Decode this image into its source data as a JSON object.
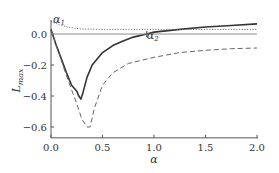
{
  "chart_data": {
    "type": "line",
    "title": "",
    "xlabel": "α",
    "ylabel": "L_max",
    "xlim": [
      0.0,
      2.0
    ],
    "ylim": [
      -0.67,
      0.09
    ],
    "grid": false,
    "legend": null,
    "x_ticks": [
      "0.0",
      "0.5",
      "1.0",
      "1.5",
      "2.0"
    ],
    "y_ticks": [
      "0.0",
      "-0.2",
      "-0.4",
      "-0.6"
    ],
    "annotations": [
      {
        "text": "α1",
        "x": 0.02,
        "y": 0.07
      },
      {
        "text": "α2",
        "x": 0.93,
        "y": -0.03
      }
    ],
    "series": [
      {
        "name": "solid",
        "style": "solid",
        "x": [
          0.0,
          0.05,
          0.1,
          0.15,
          0.2,
          0.25,
          0.27,
          0.29,
          0.31,
          0.35,
          0.4,
          0.5,
          0.6,
          0.7,
          0.8,
          0.93,
          1.0,
          1.25,
          1.5,
          1.75,
          2.0
        ],
        "values": [
          0.03,
          -0.07,
          -0.16,
          -0.25,
          -0.33,
          -0.37,
          -0.4,
          -0.42,
          -0.38,
          -0.28,
          -0.2,
          -0.12,
          -0.075,
          -0.045,
          -0.02,
          0.0,
          0.012,
          0.03,
          0.045,
          0.055,
          0.065
        ]
      },
      {
        "name": "dashed",
        "style": "dashed",
        "x": [
          0.0,
          0.05,
          0.1,
          0.15,
          0.2,
          0.25,
          0.3,
          0.35,
          0.38,
          0.42,
          0.5,
          0.6,
          0.75,
          1.0,
          1.25,
          1.5,
          1.75,
          2.0
        ],
        "values": [
          0.03,
          -0.07,
          -0.17,
          -0.27,
          -0.36,
          -0.45,
          -0.55,
          -0.6,
          -0.6,
          -0.48,
          -0.33,
          -0.25,
          -0.19,
          -0.15,
          -0.12,
          -0.105,
          -0.095,
          -0.09
        ]
      },
      {
        "name": "dotted",
        "style": "dotted",
        "x": [
          0.0,
          0.1,
          0.2,
          0.3,
          0.5,
          1.0,
          1.5,
          2.0
        ],
        "values": [
          0.08,
          0.055,
          0.04,
          0.032,
          0.03,
          0.03,
          0.03,
          0.03
        ]
      },
      {
        "name": "zero-reference",
        "style": "solid-thin",
        "x": [
          0.0,
          2.0
        ],
        "values": [
          0.0,
          0.0
        ]
      }
    ]
  }
}
